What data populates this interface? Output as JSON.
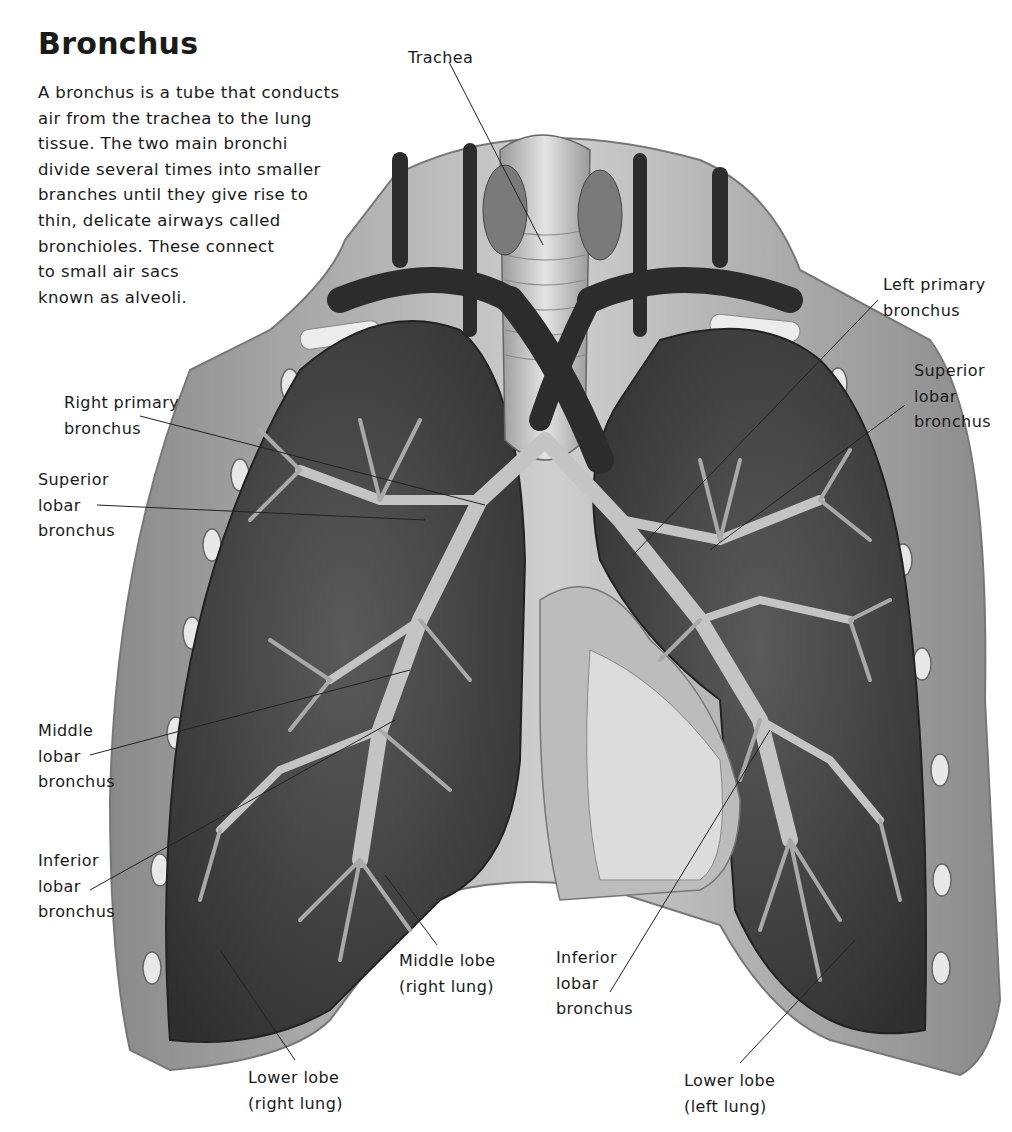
{
  "title": "Bronchus",
  "intro_lines": [
    "A bronchus is a tube that conducts",
    "air from the trachea to the lung",
    "tissue. The two main bronchi",
    "divide several times into smaller",
    "branches until they give rise to",
    "thin, delicate airways called",
    "bronchioles. These connect",
    "to small air sacs",
    "known as alveoli."
  ],
  "labels": {
    "trachea": [
      "Trachea"
    ],
    "right_primary_bronchus": [
      "Right primary",
      "bronchus"
    ],
    "right_superior_lobar_bronchus": [
      "Superior",
      "lobar",
      "bronchus"
    ],
    "middle_lobar_bronchus": [
      "Middle",
      "lobar",
      "bronchus"
    ],
    "right_inferior_lobar_bronchus": [
      "Inferior",
      "lobar",
      "bronchus"
    ],
    "lower_lobe_right": [
      "Lower lobe",
      "(right lung)"
    ],
    "middle_lobe_right": [
      "Middle lobe",
      "(right lung)"
    ],
    "left_inferior_lobar_bronchus": [
      "Inferior",
      "lobar",
      "bronchus"
    ],
    "lower_lobe_left": [
      "Lower lobe",
      "(left lung)"
    ],
    "left_primary_bronchus": [
      "Left primary",
      "bronchus"
    ],
    "left_superior_lobar_bronchus": [
      "Superior",
      "lobar",
      "bronchus"
    ]
  },
  "colors": {
    "background": "#ffffff",
    "text": "#1a1a1a",
    "tissue_dark": "#3a3a3a",
    "tissue_mid": "#6e6e6e",
    "airway": "#bdbdbd",
    "vessel": "#2c2c2c"
  }
}
